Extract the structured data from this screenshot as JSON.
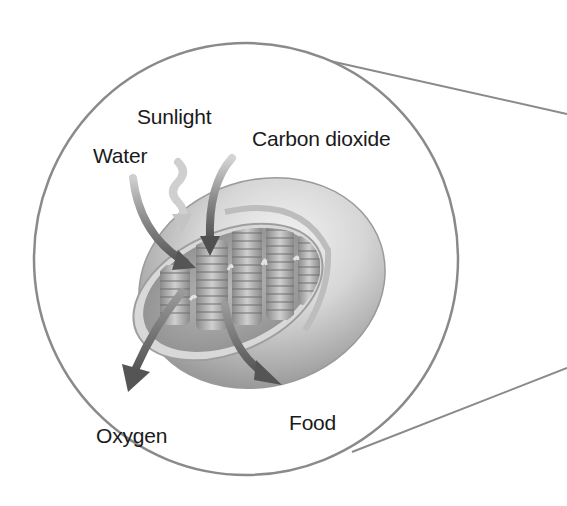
{
  "diagram": {
    "view": "magnified cutaway",
    "labels": {
      "sunlight": "Sunlight",
      "water": "Water",
      "carbon_dioxide": "Carbon dioxide",
      "oxygen": "Oxygen",
      "food": "Food"
    },
    "inputs": [
      "Sunlight",
      "Water",
      "Carbon dioxide"
    ],
    "outputs": [
      "Oxygen",
      "Food"
    ],
    "colors": {
      "outline": "#8a8a8a",
      "arrow": "#5f5f5f",
      "sunlight_arrow": "#c9c9c9",
      "body_light": "#e6e6e6",
      "body_mid": "#bdbdbd",
      "body_dark": "#8f8f8f",
      "text": "#1a1a1a",
      "background": "#ffffff"
    }
  }
}
